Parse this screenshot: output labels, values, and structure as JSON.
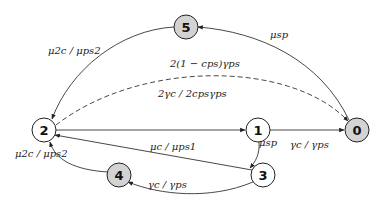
{
  "diagram": {
    "colors": {
      "shaded_node": "#d3d3d3",
      "plain_node": "#ffffff",
      "stroke": "#222222"
    },
    "nodes": [
      {
        "id": "5",
        "label": "5",
        "x": 186,
        "y": 27,
        "shaded": true
      },
      {
        "id": "2",
        "label": "2",
        "x": 44,
        "y": 130,
        "shaded": false
      },
      {
        "id": "1",
        "label": "1",
        "x": 258,
        "y": 130,
        "shaded": false
      },
      {
        "id": "0",
        "label": "0",
        "x": 357,
        "y": 130,
        "shaded": true
      },
      {
        "id": "4",
        "label": "4",
        "x": 119,
        "y": 175,
        "shaded": true
      },
      {
        "id": "3",
        "label": "3",
        "x": 263,
        "y": 175,
        "shaded": false
      }
    ],
    "edges": [
      {
        "from": "0",
        "to": "5",
        "label": "μsp",
        "style": "solid"
      },
      {
        "from": "5",
        "to": "2",
        "label": "μ2c / μps2",
        "style": "solid"
      },
      {
        "from": "2",
        "to": "0",
        "label": "2(1 − cps)γps",
        "style": "dashed"
      },
      {
        "from": "2",
        "to": "1",
        "label": "2γc / 2cpsγps",
        "style": "solid"
      },
      {
        "from": "1",
        "to": "0",
        "label": "γc / γps",
        "style": "solid"
      },
      {
        "from": "1",
        "to": "3",
        "label": "μsp",
        "style": "solid"
      },
      {
        "from": "3",
        "to": "2",
        "label": "μc / μps1",
        "style": "solid"
      },
      {
        "from": "3",
        "to": "4",
        "label": "γc / γps",
        "style": "solid"
      },
      {
        "from": "4",
        "to": "2",
        "label": "μ2c / μps2",
        "style": "solid"
      }
    ],
    "labels": {
      "e05": "μsp",
      "e52": "μ2c / μps2",
      "e20": "2(1 − cps)γps",
      "e21": "2γc / 2cpsγps",
      "e10": "γc / γps",
      "e13": "μsp",
      "e32": "μc / μps1",
      "e34": "γc / γps",
      "e42": "μ2c / μps2"
    }
  }
}
